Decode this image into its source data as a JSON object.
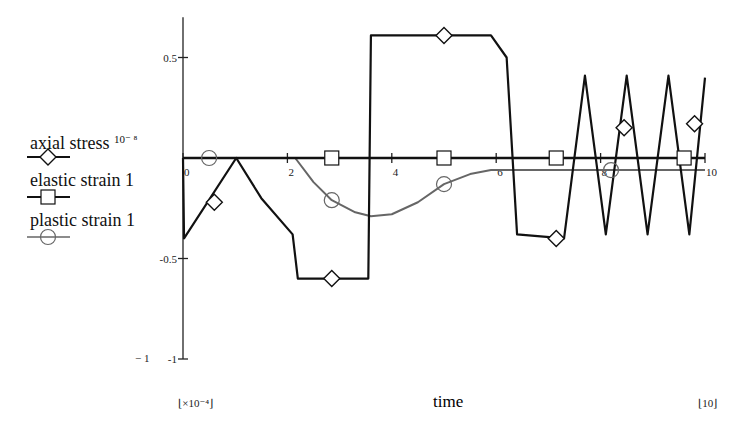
{
  "chart_data": {
    "type": "line",
    "title": "",
    "xlabel": "time",
    "ylabel": "",
    "x_scale_note": "×10⁻⁴",
    "x_end_label": "10",
    "xlim": [
      0,
      10
    ],
    "ylim": [
      -1,
      0.7
    ],
    "x_ticks": [
      "0",
      "2",
      "4",
      "6",
      "8",
      "10"
    ],
    "y_ticks": [
      "0.5",
      "-0.5",
      "-1"
    ],
    "y_min_label": "− 1",
    "grid": false,
    "legend_position": "left",
    "series": [
      {
        "name": "axial stress",
        "legend_label": "axial stress",
        "legend_scale": "10⁻ ⁸",
        "marker": "diamond",
        "color": "#111111",
        "x": [
          0,
          0.02,
          1.02,
          1.5,
          2.1,
          2.2,
          3.55,
          3.6,
          5.9,
          6.2,
          6.4,
          7.3,
          7.7,
          8.1,
          8.5,
          8.9,
          9.3,
          9.7,
          10.0
        ],
        "y": [
          0,
          -0.4,
          0,
          -0.2,
          -0.38,
          -0.6,
          -0.6,
          0.61,
          0.61,
          0.5,
          -0.38,
          -0.4,
          0.41,
          -0.38,
          0.41,
          -0.38,
          0.41,
          -0.38,
          0.4
        ],
        "marker_x": [
          0.6,
          2.85,
          5.0,
          7.15,
          8.45,
          9.8
        ],
        "marker_y": [
          -0.22,
          -0.6,
          0.61,
          -0.4,
          0.15,
          0.17
        ]
      },
      {
        "name": "elastic strain",
        "legend_label": "elastic strain 1",
        "marker": "square",
        "color": "#111111",
        "x": [
          0,
          10
        ],
        "y": [
          0,
          0
        ],
        "marker_x": [
          2.85,
          5.0,
          7.15,
          9.6
        ],
        "marker_y": [
          0,
          0,
          0,
          0
        ]
      },
      {
        "name": "plastic strain",
        "legend_label": "plastic strain 1",
        "marker": "circle",
        "color": "#666666",
        "x": [
          0,
          2.15,
          2.5,
          2.85,
          3.3,
          3.6,
          4.0,
          4.5,
          5.0,
          5.5,
          5.9,
          6.2,
          10.0
        ],
        "y": [
          0,
          0,
          -0.12,
          -0.21,
          -0.27,
          -0.29,
          -0.28,
          -0.22,
          -0.13,
          -0.08,
          -0.06,
          -0.06,
          -0.06
        ],
        "marker_x": [
          0.5,
          2.85,
          5.0,
          8.2
        ],
        "marker_y": [
          0,
          -0.21,
          -0.13,
          -0.06
        ]
      }
    ]
  }
}
